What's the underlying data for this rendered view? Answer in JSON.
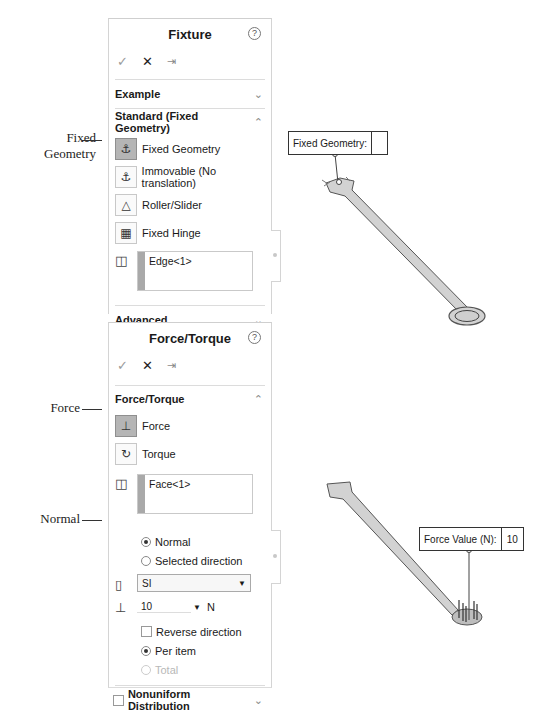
{
  "fixture_panel": {
    "title": "Fixture",
    "help_icon": "question-circle-icon",
    "actions": {
      "ok": "✓",
      "cancel": "✕",
      "pin": "⇥"
    },
    "example_label": "Example",
    "standard_section": "Standard (Fixed Geometry)",
    "options": [
      {
        "label": "Fixed Geometry",
        "active": true,
        "icon": "fixed-geometry-icon"
      },
      {
        "label": "Immovable (No translation)",
        "active": false,
        "icon": "immovable-icon"
      },
      {
        "label": "Roller/Slider",
        "active": false,
        "icon": "roller-slider-icon"
      },
      {
        "label": "Fixed Hinge",
        "active": false,
        "icon": "fixed-hinge-icon"
      }
    ],
    "selection": "Edge<1>",
    "advanced_label": "Advanced"
  },
  "force_panel": {
    "title": "Force/Torque",
    "help_icon": "question-circle-icon",
    "actions": {
      "ok": "✓",
      "cancel": "✕",
      "pin": "⇥"
    },
    "section": "Force/Torque",
    "options": [
      {
        "label": "Force",
        "active": true,
        "icon": "force-icon"
      },
      {
        "label": "Torque",
        "active": false,
        "icon": "torque-icon"
      }
    ],
    "selection": "Face<1>",
    "direction": {
      "normal": "Normal",
      "selected": "Selected direction",
      "value": "Normal"
    },
    "units": "SI",
    "force_value": "10",
    "force_unit": "N",
    "reverse_label": "Reverse direction",
    "per_item_label": "Per item",
    "total_label": "Total",
    "nonuniform_label": "Nonuniform Distribution"
  },
  "callouts": {
    "fixed_line1": "Fixed",
    "fixed_line2": "Geometry",
    "force": "Force",
    "normal": "Normal"
  },
  "viewport": {
    "fixed_tag_label": "Fixed Geometry:",
    "fixed_tag_value": "",
    "force_tag_label": "Force Value (N):",
    "force_tag_value": "10"
  }
}
